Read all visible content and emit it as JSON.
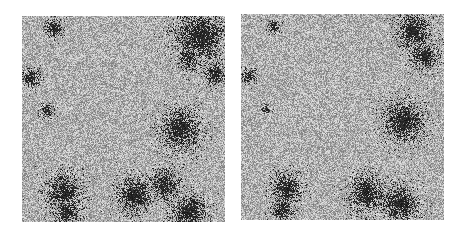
{
  "figure": {
    "panels": [
      {
        "id": "left",
        "description": "particle simulation snapshot, dark clusters on gray noisy background",
        "background_color": "#a9a9a9",
        "cluster_color": "#1a1a1a",
        "clusters": [
          {
            "cx": 0.88,
            "cy": 0.1,
            "r": 0.11
          },
          {
            "cx": 0.82,
            "cy": 0.2,
            "r": 0.05
          },
          {
            "cx": 0.95,
            "cy": 0.28,
            "r": 0.05
          },
          {
            "cx": 0.78,
            "cy": 0.55,
            "r": 0.09
          },
          {
            "cx": 0.2,
            "cy": 0.85,
            "r": 0.08
          },
          {
            "cx": 0.22,
            "cy": 0.95,
            "r": 0.06
          },
          {
            "cx": 0.55,
            "cy": 0.87,
            "r": 0.08
          },
          {
            "cx": 0.7,
            "cy": 0.82,
            "r": 0.07
          },
          {
            "cx": 0.82,
            "cy": 0.95,
            "r": 0.08
          },
          {
            "cx": 0.16,
            "cy": 0.06,
            "r": 0.04
          },
          {
            "cx": 0.04,
            "cy": 0.3,
            "r": 0.04
          },
          {
            "cx": 0.12,
            "cy": 0.46,
            "r": 0.03
          }
        ]
      },
      {
        "id": "right",
        "description": "particle simulation snapshot, later state with similar clusters",
        "background_color": "#a9a9a9",
        "cluster_color": "#1a1a1a",
        "clusters": [
          {
            "cx": 0.85,
            "cy": 0.08,
            "r": 0.08
          },
          {
            "cx": 0.9,
            "cy": 0.2,
            "r": 0.06
          },
          {
            "cx": 0.8,
            "cy": 0.52,
            "r": 0.09
          },
          {
            "cx": 0.22,
            "cy": 0.85,
            "r": 0.07
          },
          {
            "cx": 0.2,
            "cy": 0.95,
            "r": 0.05
          },
          {
            "cx": 0.62,
            "cy": 0.87,
            "r": 0.08
          },
          {
            "cx": 0.78,
            "cy": 0.92,
            "r": 0.08
          },
          {
            "cx": 0.16,
            "cy": 0.06,
            "r": 0.03
          },
          {
            "cx": 0.04,
            "cy": 0.3,
            "r": 0.03
          },
          {
            "cx": 0.12,
            "cy": 0.46,
            "r": 0.02
          }
        ]
      }
    ]
  }
}
